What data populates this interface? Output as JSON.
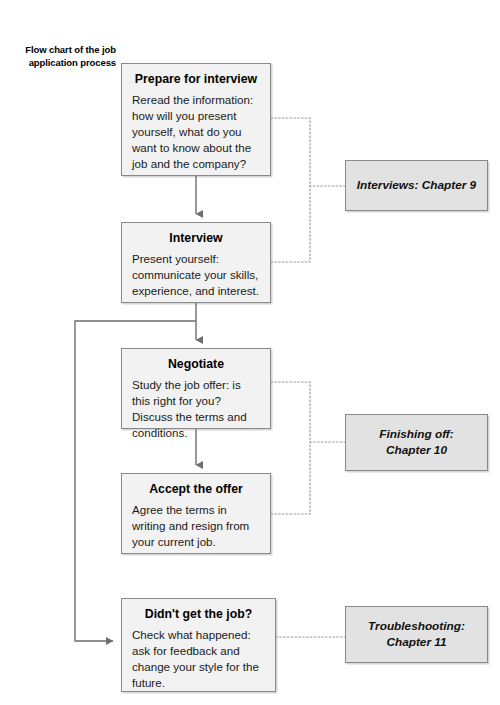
{
  "caption": {
    "text": "Flow chart of the job application process"
  },
  "colors": {
    "node_fill": "#f2f2f2",
    "chapter_fill": "#e2e2e2",
    "border": "#8a8a8a",
    "connector_solid": "#6e6e6e",
    "connector_dotted": "#9a9a9a",
    "text": "#1a1a1a",
    "page_background": "#ffffff"
  },
  "nodes": [
    {
      "id": "prepare",
      "title": "Prepare for interview",
      "body": "Reread the information: how will you present yourself, what do you want to know about the job and the company?"
    },
    {
      "id": "interview",
      "title": "Interview",
      "body": "Present yourself: communicate your skills, experience, and interest."
    },
    {
      "id": "negotiate",
      "title": "Negotiate",
      "body": "Study the job offer: is this right for you? Discuss the terms and conditions."
    },
    {
      "id": "accept",
      "title": "Accept the offer",
      "body": "Agree the terms in writing and resign from your current job."
    },
    {
      "id": "rejected",
      "title": "Didn't get the job?",
      "body": "Check what happened: ask for feedback and change your style for the future."
    }
  ],
  "chapters": [
    {
      "id": "chapter-9",
      "text": "Interviews: Chapter 9"
    },
    {
      "id": "chapter-10",
      "text": "Finishing off:\nChapter 10"
    },
    {
      "id": "chapter-11",
      "text": "Troubleshooting:\nChapter 11"
    }
  ],
  "connectors": [
    {
      "name": "prepare-to-interview",
      "style": "solid-arrow"
    },
    {
      "name": "interview-to-negotiate",
      "style": "solid-arrow"
    },
    {
      "name": "negotiate-to-accept",
      "style": "solid-arrow"
    },
    {
      "name": "interview-to-rejected-loop",
      "style": "solid-arrow"
    },
    {
      "name": "prepare-to-chapter-9",
      "style": "dotted"
    },
    {
      "name": "interview-to-chapter-9",
      "style": "dotted"
    },
    {
      "name": "negotiate-to-chapter-10",
      "style": "dotted"
    },
    {
      "name": "accept-to-chapter-10",
      "style": "dotted"
    },
    {
      "name": "rejected-to-chapter-11",
      "style": "dotted"
    }
  ]
}
